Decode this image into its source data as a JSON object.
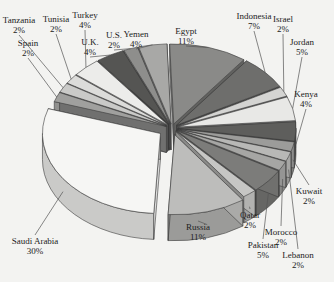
{
  "chart_data": {
    "type": "pie",
    "style": "3d-exploded",
    "title": "",
    "unit": "%",
    "slices": [
      {
        "label": "Egypt",
        "value": 11,
        "display": "11%",
        "color": "#8a8a88"
      },
      {
        "label": "Indonesia",
        "value": 7,
        "display": "7%",
        "color": "#6e6e6c"
      },
      {
        "label": "Israel",
        "value": 2,
        "display": "2%",
        "color": "#d4d4d2"
      },
      {
        "label": "Jordan",
        "value": 5,
        "display": "5%",
        "color": "#e8e8e6"
      },
      {
        "label": "Kenya",
        "value": 4,
        "display": "4%",
        "color": "#5e5e5c"
      },
      {
        "label": "Kuwait",
        "value": 2,
        "display": "2%",
        "color": "#9c9c9a"
      },
      {
        "label": "Lebanon",
        "value": 2,
        "display": "2%",
        "color": "#b8b8b6"
      },
      {
        "label": "Morocco",
        "value": 2,
        "display": "2%",
        "color": "#a6a6a4"
      },
      {
        "label": "Pakistan",
        "value": 5,
        "display": "5%",
        "color": "#7c7c7a"
      },
      {
        "label": "Qatar",
        "value": 2,
        "display": "2%",
        "color": "#c6c6c4"
      },
      {
        "label": "Russia",
        "value": 11,
        "display": "11%",
        "color": "#bdbdbb"
      },
      {
        "label": "Saudi Arabia",
        "value": 30,
        "display": "30%",
        "color": "#f6f6f4"
      },
      {
        "label": "Spain",
        "value": 2,
        "display": "2%",
        "color": "#a0a09e"
      },
      {
        "label": "Tanzania",
        "value": 2,
        "display": "2%",
        "color": "#cacac8"
      },
      {
        "label": "Tunisia",
        "value": 2,
        "display": "2%",
        "color": "#dcdcda"
      },
      {
        "label": "Turkey",
        "value": 4,
        "display": "4%",
        "color": "#ececea"
      },
      {
        "label": "U.K.",
        "value": 4,
        "display": "4%",
        "color": "#555553"
      },
      {
        "label": "U.S.",
        "value": 2,
        "display": "2%",
        "color": "#8e8e8c"
      },
      {
        "label": "Yemen",
        "value": 4,
        "display": "4%",
        "color": "#a8a8a6"
      }
    ],
    "legend": "none",
    "labels": "outside-with-leader-lines"
  }
}
